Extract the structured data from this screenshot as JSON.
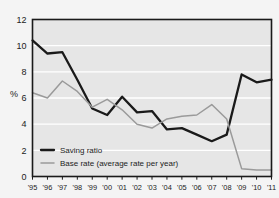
{
  "figure": {
    "background_color": "#f4f4f4",
    "plot_background_color": "#e6e6e6",
    "gridline_color": "#ffffff",
    "border_color": "#1a1a1a",
    "axis_title": "%"
  },
  "legend": {
    "position": "bottom-left",
    "entries": [
      {
        "label": "Saving ratio",
        "color": "#1a1a1a",
        "swatch": "line-swatch-black"
      },
      {
        "label": "Base rate (average rate per year)",
        "color": "#9a9a9a",
        "swatch": "line-swatch-gray"
      }
    ]
  },
  "chart_data": {
    "type": "line",
    "title": "",
    "subtitle": "",
    "xlabel": "",
    "ylabel": "%",
    "xlim": [
      0,
      16
    ],
    "ylim": [
      0,
      12
    ],
    "yticks": [
      0,
      2,
      4,
      6,
      8,
      10,
      12
    ],
    "grid": true,
    "legend_position": "bottom-left",
    "categories": [
      "'95",
      "'96",
      "'97",
      "'98",
      "'99",
      "'00",
      "'01",
      "'02",
      "'03",
      "'04",
      "'05",
      "'06",
      "'07",
      "'08",
      "'09",
      "'10",
      "'11"
    ],
    "series": [
      {
        "name": "Saving ratio",
        "color": "#1a1a1a",
        "values": [
          10.4,
          9.4,
          9.5,
          7.4,
          5.2,
          4.7,
          6.1,
          4.9,
          5.0,
          3.6,
          3.7,
          3.2,
          2.7,
          3.2,
          7.8,
          7.2,
          7.4
        ]
      },
      {
        "name": "Base rate (average rate per year)",
        "color": "#9a9a9a",
        "values": [
          6.4,
          6.0,
          7.3,
          6.5,
          5.3,
          5.9,
          5.1,
          4.0,
          3.7,
          4.4,
          4.6,
          4.7,
          5.5,
          4.4,
          0.6,
          0.5,
          0.5
        ]
      }
    ]
  }
}
